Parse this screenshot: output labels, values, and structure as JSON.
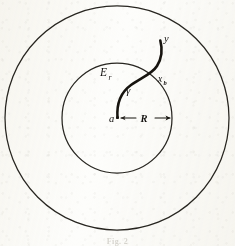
{
  "figure": {
    "caption": "Fig. 2",
    "background_color": "#fdfdfb",
    "ink_color": "#141210",
    "labels": {
      "outer_region": "E",
      "outer_region_subscript": "r",
      "curve": "γ",
      "center_point": "a",
      "radius": "R",
      "boundary_point": "x",
      "boundary_point_subscript": "b",
      "endpoint": "y"
    },
    "geometry": {
      "center_x": 117,
      "center_y": 118,
      "outer_circle_radius": 112,
      "inner_circle_radius": 55,
      "radius_arrow_from_x": 117,
      "radius_arrow_to_x": 172,
      "radius_arrow_y": 118
    }
  }
}
